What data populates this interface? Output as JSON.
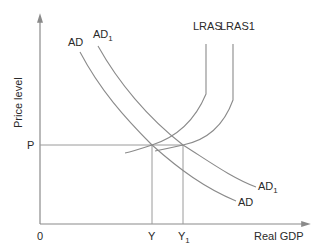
{
  "diagram": {
    "axes": {
      "y_label": "Price level",
      "x_label": "Real GDP",
      "origin_label": "0"
    },
    "markers": {
      "price": "P",
      "output": "Y",
      "output_new_base": "Y",
      "output_new_sub": "1"
    },
    "curves": {
      "ad": "AD",
      "ad1_base": "AD",
      "ad1_sub": "1",
      "lras": "LRAS",
      "lras1": "LRAS1"
    },
    "colors": {
      "line": "#8a8a8a",
      "text": "#2a2a2a",
      "background": "#ffffff"
    }
  }
}
